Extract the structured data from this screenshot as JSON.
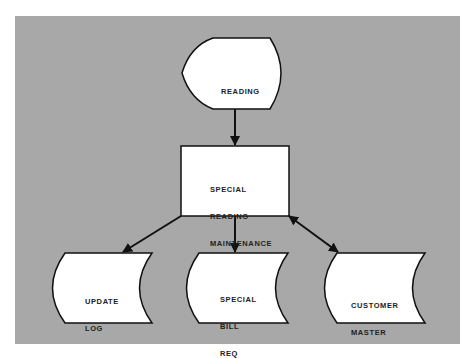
{
  "diagram": {
    "type": "system-flowchart",
    "colors": {
      "panel": "#a8a8a8",
      "shape_fill": "#ffffff",
      "stroke": "#111111",
      "text": "#222222"
    },
    "nodes": [
      {
        "id": "reading",
        "shape": "display",
        "lines": [
          "READING"
        ]
      },
      {
        "id": "maintenance",
        "shape": "process",
        "lines": [
          "SPECIAL",
          "READING",
          "MAINTENANCE"
        ]
      },
      {
        "id": "update_log",
        "shape": "stored-data",
        "lines": [
          "UPDATE",
          "LOG"
        ]
      },
      {
        "id": "bill_req",
        "shape": "stored-data",
        "lines": [
          "SPECIAL",
          "BILL",
          "REQ"
        ]
      },
      {
        "id": "customer_master",
        "shape": "stored-data",
        "lines": [
          "CUSTOMER",
          "MASTER"
        ]
      }
    ],
    "edges": [
      {
        "from": "reading",
        "to": "maintenance",
        "direction": "forward"
      },
      {
        "from": "maintenance",
        "to": "update_log",
        "direction": "forward"
      },
      {
        "from": "maintenance",
        "to": "bill_req",
        "direction": "forward"
      },
      {
        "from": "maintenance",
        "to": "customer_master",
        "direction": "both"
      }
    ]
  }
}
